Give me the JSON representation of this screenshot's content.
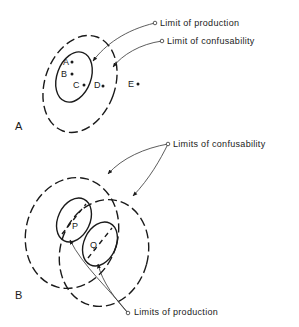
{
  "figure": {
    "panel_a": {
      "label": "A",
      "callouts": {
        "production": "Limit of production",
        "confusability": "Limit of confusability"
      },
      "points": [
        {
          "id": "A",
          "label": "A"
        },
        {
          "id": "B",
          "label": "B"
        },
        {
          "id": "C",
          "label": "C"
        },
        {
          "id": "D",
          "label": "D"
        },
        {
          "id": "E",
          "label": "E"
        }
      ]
    },
    "panel_b": {
      "label": "B",
      "callouts": {
        "confusability": "Limits of confusability",
        "production": "Limits of production"
      },
      "regions": [
        {
          "id": "P",
          "label": "P"
        },
        {
          "id": "Q",
          "label": "Q"
        }
      ]
    }
  }
}
